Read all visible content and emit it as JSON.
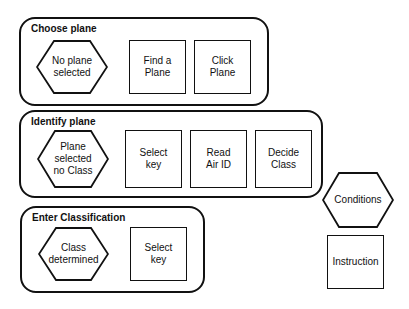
{
  "groups": [
    {
      "title": "Choose plane",
      "condition": "No plane\nselected",
      "instructions": [
        "Find a\nPlane",
        "Click\nPlane"
      ]
    },
    {
      "title": "Identify plane",
      "condition": "Plane\nselected\nno Class",
      "instructions": [
        "Select\nkey",
        "Read\nAir ID",
        "Decide\nClass"
      ]
    },
    {
      "title": "Enter Classification",
      "condition": "Class\ndetermined",
      "instructions": [
        "Select\nkey"
      ]
    }
  ],
  "legend": {
    "conditions_label": "Conditions",
    "instruction_label": "Instruction"
  }
}
